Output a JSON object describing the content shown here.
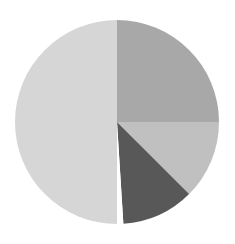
{
  "chart_data": {
    "type": "pie",
    "title": "",
    "start_angle_deg": 90,
    "direction": "clockwise",
    "center": [
      117,
      122
    ],
    "radius": 102,
    "slices": [
      {
        "label": "",
        "value": 25,
        "color": "#a8a8a8"
      },
      {
        "label": "",
        "value": 12.5,
        "color": "#c0c0c0"
      },
      {
        "label": "",
        "value": 11.5,
        "color": "#585858"
      },
      {
        "label": "",
        "value": 1,
        "color": "#ffffff"
      },
      {
        "label": "",
        "value": 50,
        "color": "#d6d6d6"
      }
    ],
    "legend": null,
    "labels_visible": false
  }
}
